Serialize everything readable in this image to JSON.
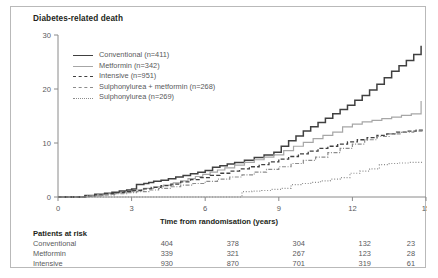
{
  "figure": {
    "title": "Diabetes-related death",
    "border_color": "#b9b9b9"
  },
  "risk": {
    "heading": "Patients at risk",
    "rows": [
      {
        "label": "Conventional",
        "values": [
          "404",
          "378",
          "304",
          "132",
          "23"
        ]
      },
      {
        "label": "Metformin",
        "values": [
          "339",
          "321",
          "267",
          "123",
          "28"
        ]
      },
      {
        "label": "Intensive",
        "values": [
          "930",
          "870",
          "701",
          "319",
          "61"
        ]
      }
    ]
  },
  "chart_data": {
    "type": "line",
    "title": "Diabetes-related death",
    "xlabel": "Time from randomisation (years)",
    "ylabel": "",
    "xlim": [
      0,
      15
    ],
    "ylim": [
      0,
      30
    ],
    "xticks": [
      0,
      3,
      6,
      9,
      12,
      15
    ],
    "yticks": [
      0,
      10,
      20,
      30
    ],
    "grid": false,
    "legend_position": "upper-left",
    "series": [
      {
        "name": "Conventional (n=411)",
        "label": "Conventional",
        "n": 411,
        "color": "#404040",
        "dash": "solid",
        "width": 1.5,
        "x": [
          0,
          1.1,
          1.5,
          1.9,
          2.2,
          2.5,
          2.8,
          3.0,
          3.2,
          3.5,
          3.7,
          3.9,
          4.2,
          4.5,
          4.8,
          5.1,
          5.4,
          5.7,
          6.0,
          6.3,
          6.6,
          6.9,
          7.2,
          7.6,
          8.0,
          8.4,
          8.8,
          9.1,
          9.4,
          9.7,
          10.0,
          10.3,
          10.6,
          10.9,
          11.2,
          11.5,
          11.8,
          12.1,
          12.4,
          12.7,
          13.0,
          13.3,
          13.6,
          13.9,
          14.2,
          14.5,
          14.8
        ],
        "y": [
          0,
          0.3,
          0.5,
          0.7,
          0.9,
          1.1,
          1.3,
          1.5,
          2.3,
          2.5,
          2.7,
          2.9,
          3.1,
          3.4,
          3.7,
          4.0,
          4.3,
          4.6,
          4.9,
          5.5,
          5.8,
          6.1,
          6.4,
          6.8,
          7.3,
          7.8,
          8.3,
          9.4,
          10.4,
          11.3,
          12.2,
          13.0,
          13.8,
          14.6,
          15.4,
          16.2,
          17.0,
          17.9,
          18.8,
          19.8,
          20.9,
          22.1,
          23.3,
          24.3,
          25.3,
          26.4,
          28.0
        ]
      },
      {
        "name": "Metformin (n=342)",
        "label": "Metformin",
        "n": 342,
        "color": "#a6a6a6",
        "dash": "solid",
        "width": 1.2,
        "x": [
          0,
          1.2,
          1.6,
          2.0,
          2.4,
          2.8,
          3.1,
          3.5,
          3.9,
          4.3,
          4.7,
          5.0,
          5.3,
          5.6,
          5.9,
          6.2,
          6.5,
          6.8,
          7.2,
          7.6,
          8.0,
          8.4,
          8.8,
          9.2,
          9.6,
          10.0,
          10.4,
          10.8,
          11.2,
          11.6,
          12.0,
          12.4,
          12.8,
          13.2,
          13.6,
          14.0,
          14.4,
          14.8
        ],
        "y": [
          0,
          0.2,
          0.4,
          0.6,
          0.8,
          1.0,
          1.3,
          1.6,
          1.9,
          2.2,
          2.6,
          3.0,
          3.4,
          3.8,
          4.2,
          4.6,
          5.0,
          5.4,
          5.9,
          6.4,
          6.9,
          7.4,
          7.8,
          8.6,
          9.4,
          10.1,
          10.8,
          11.4,
          12.0,
          13.0,
          13.5,
          13.9,
          14.2,
          14.5,
          14.8,
          15.1,
          15.4,
          17.8
        ]
      },
      {
        "name": "Intensive (n=951)",
        "label": "Intensive",
        "n": 951,
        "color": "#404040",
        "dash": "dashed",
        "width": 1.3,
        "x": [
          0,
          1.1,
          1.5,
          1.9,
          2.3,
          2.7,
          3.0,
          3.4,
          3.8,
          4.2,
          4.6,
          5.0,
          5.4,
          5.8,
          6.2,
          6.6,
          7.0,
          7.4,
          7.8,
          8.2,
          8.6,
          9.0,
          9.4,
          9.8,
          10.2,
          10.6,
          11.0,
          11.4,
          11.8,
          12.2,
          12.6,
          13.0,
          13.4,
          13.8,
          14.2,
          14.6,
          14.9
        ],
        "y": [
          0,
          0.2,
          0.4,
          0.6,
          0.8,
          1.0,
          1.2,
          1.5,
          1.8,
          2.1,
          2.4,
          2.8,
          3.2,
          3.6,
          4.0,
          4.4,
          4.8,
          5.2,
          5.6,
          6.0,
          6.5,
          7.0,
          7.5,
          8.0,
          8.5,
          9.0,
          9.4,
          9.8,
          10.2,
          10.6,
          11.0,
          11.4,
          11.7,
          12.0,
          12.2,
          12.4,
          12.6
        ]
      },
      {
        "name": "Sulphonylurea + metformin (n=268)",
        "label": "Sulphonylurea + metformin",
        "n": 268,
        "color": "#8c8c8c",
        "dash": "dashdot",
        "width": 1.2,
        "x": [
          0,
          1.3,
          1.8,
          2.3,
          2.8,
          3.2,
          3.7,
          4.1,
          4.6,
          5.0,
          5.5,
          6.0,
          6.5,
          7.0,
          7.5,
          8.0,
          8.5,
          9.0,
          9.5,
          10.0,
          10.5,
          11.0,
          11.5,
          12.0,
          12.5,
          13.0,
          13.5,
          14.0,
          14.5,
          14.9
        ],
        "y": [
          0,
          0.2,
          0.4,
          0.6,
          0.8,
          1.0,
          1.3,
          1.6,
          1.9,
          2.2,
          2.5,
          2.9,
          3.3,
          3.7,
          4.1,
          4.6,
          5.1,
          5.6,
          6.2,
          6.8,
          7.4,
          8.2,
          9.0,
          9.8,
          10.6,
          11.2,
          11.7,
          12.0,
          12.2,
          12.3
        ]
      },
      {
        "name": "Sulphonylurea (n=269)",
        "label": "Sulphonylurea",
        "n": 269,
        "color": "#8c8c8c",
        "dash": "dotted",
        "width": 1.2,
        "x": [
          0,
          7.4,
          7.5,
          7.9,
          8.3,
          8.7,
          9.1,
          9.5,
          9.9,
          10.3,
          10.7,
          11.1,
          11.5,
          11.9,
          12.3,
          12.7,
          13.1,
          13.5,
          13.9,
          14.3,
          14.7,
          14.9
        ],
        "y": [
          0,
          0,
          1.0,
          1.1,
          1.2,
          1.4,
          1.6,
          2.3,
          2.5,
          2.7,
          3.0,
          3.3,
          3.6,
          4.4,
          4.8,
          5.2,
          6.0,
          6.2,
          6.3,
          6.4,
          6.4,
          6.4
        ]
      }
    ]
  }
}
